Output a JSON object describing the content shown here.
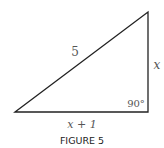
{
  "figure": {
    "caption": "FIGURE 5",
    "shape": "right-triangle",
    "vertices": {
      "bottom_left": [
        15,
        112
      ],
      "top_right": [
        148,
        12
      ],
      "bottom_right": [
        148,
        112
      ]
    },
    "labels": {
      "hypotenuse": "5",
      "vertical_side": "x",
      "horizontal_side": "x + 1",
      "right_angle": "90°"
    },
    "colors": {
      "stroke": "#222222",
      "label": "#555555",
      "caption": "#222222"
    }
  }
}
